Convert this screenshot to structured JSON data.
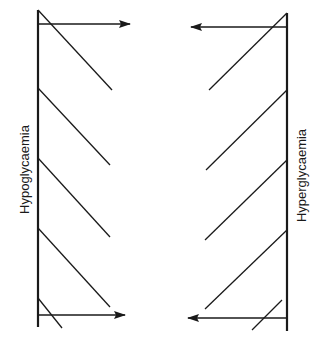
{
  "diagram": {
    "type": "two-sided bar diagram with diagonal hatches and arrows",
    "left": {
      "label": "Hypoglycaemia",
      "bar_x": 38,
      "bar_y_top": 10,
      "bar_y_bottom": 327,
      "hatch_lines": [
        {
          "x1": 38,
          "y1": 10,
          "x2": 112,
          "y2": 90
        },
        {
          "x1": 38,
          "y1": 88,
          "x2": 110,
          "y2": 165
        },
        {
          "x1": 38,
          "y1": 158,
          "x2": 110,
          "y2": 237
        },
        {
          "x1": 38,
          "y1": 228,
          "x2": 110,
          "y2": 307
        },
        {
          "x1": 38,
          "y1": 298,
          "x2": 62,
          "y2": 328
        }
      ],
      "arrows": [
        {
          "x1": 38,
          "y1": 24,
          "x2": 130,
          "y2": 24,
          "direction": "right"
        },
        {
          "x1": 38,
          "y1": 315,
          "x2": 125,
          "y2": 315,
          "direction": "right"
        }
      ]
    },
    "right": {
      "label": "Hyperglycaemia",
      "bar_x": 287,
      "bar_y_top": 13,
      "bar_y_bottom": 331,
      "hatch_lines": [
        {
          "x1": 287,
          "y1": 13,
          "x2": 209,
          "y2": 90
        },
        {
          "x1": 287,
          "y1": 90,
          "x2": 206,
          "y2": 170
        },
        {
          "x1": 287,
          "y1": 160,
          "x2": 205,
          "y2": 240
        },
        {
          "x1": 287,
          "y1": 230,
          "x2": 205,
          "y2": 309
        },
        {
          "x1": 282,
          "y1": 300,
          "x2": 252,
          "y2": 330
        }
      ],
      "arrows": [
        {
          "x1": 287,
          "y1": 27,
          "x2": 191,
          "y2": 27,
          "direction": "left"
        },
        {
          "x1": 287,
          "y1": 318,
          "x2": 188,
          "y2": 318,
          "direction": "left"
        }
      ]
    },
    "colors": {
      "line": "#1a1a1a",
      "background": "#ffffff"
    }
  }
}
